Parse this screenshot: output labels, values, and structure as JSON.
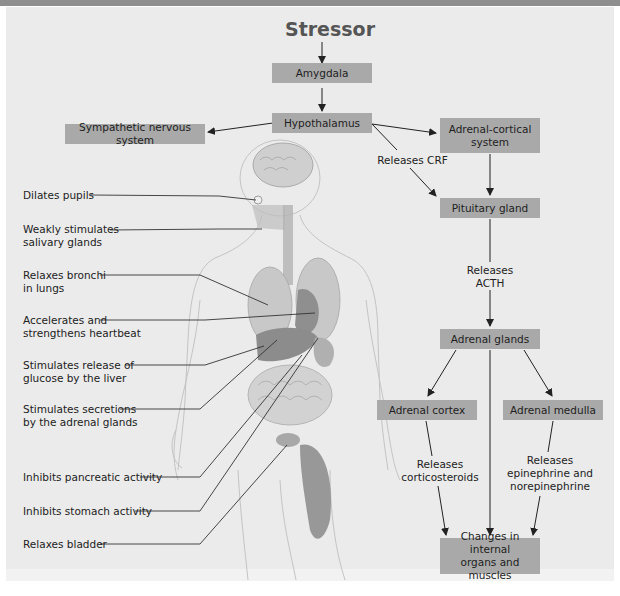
{
  "header": {
    "title_cut_off": ""
  },
  "title": "Stressor",
  "flow_boxes": {
    "amygdala": "Amygdala",
    "hypothalamus": "Hypothalamus",
    "sympathetic": "Sympathetic nervous system",
    "adrenal_cortical_1": "Adrenal-cortical",
    "adrenal_cortical_2": "system",
    "pituitary": "Pituitary gland",
    "adrenal_glands": "Adrenal glands",
    "adrenal_cortex": "Adrenal cortex",
    "adrenal_medulla": "Adrenal medulla",
    "changes_1": "Changes in internal",
    "changes_2": "organs and muscles"
  },
  "flow_labels": {
    "releases_crf": "Releases CRF",
    "releases_acth": "Releases ACTH",
    "releases_cortico_1": "Releases",
    "releases_cortico_2": "corticosteroids",
    "releases_epi_1": "Releases",
    "releases_epi_2": "epinephrine and",
    "releases_epi_3": "norepinephrine"
  },
  "callouts": [
    {
      "line1": "Dilates pupils",
      "line2": ""
    },
    {
      "line1": "Weakly stimulates",
      "line2": "salivary glands"
    },
    {
      "line1": "Relaxes bronchi",
      "line2": "in lungs"
    },
    {
      "line1": "Accelerates and",
      "line2": "strengthens heartbeat"
    },
    {
      "line1": "Stimulates release of",
      "line2": "glucose by the liver"
    },
    {
      "line1": "Stimulates secretions",
      "line2": "by the adrenal glands"
    },
    {
      "line1": "Inhibits pancreatic activity",
      "line2": ""
    },
    {
      "line1": "Inhibits stomach activity",
      "line2": ""
    },
    {
      "line1": "Relaxes bladder",
      "line2": ""
    }
  ],
  "colors": {
    "panel": "#ebebeb",
    "box": "#a9a9a9",
    "topbar": "#8e8e8e",
    "organ": "#9a9a9a"
  }
}
